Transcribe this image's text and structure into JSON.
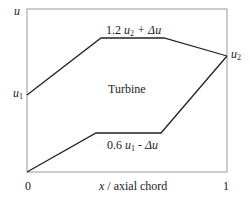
{
  "diagram": {
    "type": "velocity-distribution",
    "axes": {
      "y_label": "u",
      "x_label": "x / axial chord",
      "x_ticks": [
        "0",
        "1"
      ]
    },
    "region_label": "Turbine",
    "curves": {
      "upper": {
        "label": "1.2 u2 + Δu",
        "label_parts": {
          "coef": "1.2",
          "var": "u",
          "sub": "2",
          "rest": " + Δu"
        },
        "points": [
          [
            0,
            0.53
          ],
          [
            0.37,
            0.82
          ],
          [
            0.69,
            0.82
          ],
          [
            1,
            0.73
          ]
        ]
      },
      "lower": {
        "label": "0.6 u1 - Δu",
        "label_parts": {
          "coef": "0.6",
          "var": "u",
          "sub": "1",
          "rest": " - Δu"
        },
        "points": [
          [
            0,
            0
          ],
          [
            0.345,
            0.24
          ],
          [
            0.67,
            0.24
          ],
          [
            1,
            0.73
          ]
        ]
      }
    },
    "point_labels": {
      "u1": {
        "var": "u",
        "sub": "1"
      },
      "u2": {
        "var": "u",
        "sub": "2"
      }
    },
    "colors": {
      "line": "#222222",
      "frame": "#9a9a9a"
    }
  }
}
